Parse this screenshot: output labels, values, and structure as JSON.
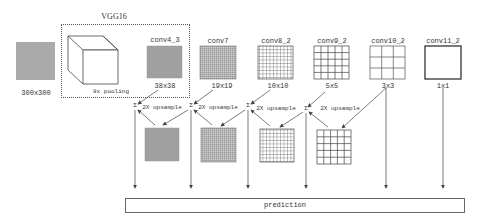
{
  "diagram": {
    "backbone_label": "VGG16",
    "pooling_label": "8x pooling",
    "input": {
      "size_label": "300x300",
      "fill": "#a9a9a9"
    },
    "feature_maps": [
      {
        "name": "conv4_3",
        "size": "38x38",
        "grid": 38
      },
      {
        "name": "conv7",
        "size": "19x19",
        "grid": 19
      },
      {
        "name": "conv8_2",
        "size": "10x10",
        "grid": 10
      },
      {
        "name": "conv9_2",
        "size": "5x5",
        "grid": 5
      },
      {
        "name": "conv10_2",
        "size": "3x3",
        "grid": 3
      },
      {
        "name": "conv11_2",
        "size": "1x1",
        "grid": 1
      }
    ],
    "sum_symbol": "Σ",
    "upsample_labels": [
      "2X upsample",
      "2X upsample",
      "2X upsample",
      "2X upsample"
    ],
    "upsampled_maps": [
      {
        "grid": 38
      },
      {
        "grid": 19
      },
      {
        "grid": 10
      },
      {
        "grid": 5
      }
    ],
    "output_label": "prediction",
    "colors": {
      "line": "#444444",
      "grid": "#555555",
      "dense_fill": "#9a9a9a",
      "box": "#666666"
    }
  }
}
